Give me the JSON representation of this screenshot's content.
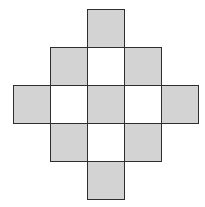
{
  "diagram": {
    "type": "grid-figure",
    "colors": {
      "shaded": "#d3d3d3",
      "unshaded": "#ffffff",
      "border": "#2e2e2e"
    },
    "grid": {
      "origin_x": 13,
      "origin_y": 9,
      "cell_w": 37,
      "cell_h": 38
    },
    "cells": [
      {
        "row": 0,
        "col": 2,
        "fill": "shaded"
      },
      {
        "row": 1,
        "col": 1,
        "fill": "shaded"
      },
      {
        "row": 1,
        "col": 2,
        "fill": "unshaded"
      },
      {
        "row": 1,
        "col": 3,
        "fill": "shaded"
      },
      {
        "row": 2,
        "col": 0,
        "fill": "shaded"
      },
      {
        "row": 2,
        "col": 1,
        "fill": "unshaded"
      },
      {
        "row": 2,
        "col": 2,
        "fill": "shaded"
      },
      {
        "row": 2,
        "col": 3,
        "fill": "unshaded"
      },
      {
        "row": 2,
        "col": 4,
        "fill": "shaded"
      },
      {
        "row": 3,
        "col": 1,
        "fill": "shaded"
      },
      {
        "row": 3,
        "col": 2,
        "fill": "unshaded"
      },
      {
        "row": 3,
        "col": 3,
        "fill": "shaded"
      },
      {
        "row": 4,
        "col": 2,
        "fill": "shaded"
      }
    ]
  }
}
